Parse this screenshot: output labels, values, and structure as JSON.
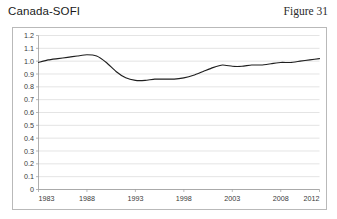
{
  "header": {
    "title": "Canada-SOFI",
    "figure_label": "Figure 31"
  },
  "chart_data": {
    "type": "line",
    "title": "Canada-SOFI",
    "xlabel": "",
    "ylabel": "",
    "xlim": [
      1983,
      2012
    ],
    "ylim": [
      0,
      1.2
    ],
    "grid": true,
    "legend": false,
    "line_color": "#1f1f1f",
    "grid_color": "#d9d9d9",
    "axis_color": "#9a9a9a",
    "xticks": [
      "1983",
      "1988",
      "1993",
      "1998",
      "2003",
      "2008",
      "2012"
    ],
    "xtick_values": [
      1983,
      1988,
      1993,
      1998,
      2003,
      2008,
      2012
    ],
    "yticks": [
      "0",
      "0.1",
      "0.2",
      "0.3",
      "0.4",
      "0.5",
      "0.6",
      "0.7",
      "0.8",
      "0.9",
      "1.0",
      "1.1",
      "1.2"
    ],
    "ytick_values": [
      0,
      0.1,
      0.2,
      0.3,
      0.4,
      0.5,
      0.6,
      0.7,
      0.8,
      0.9,
      1.0,
      1.1,
      1.2
    ],
    "series": [
      {
        "name": "Canada-SOFI",
        "x": [
          1983,
          1984,
          1985,
          1986,
          1987,
          1988,
          1989,
          1990,
          1991,
          1992,
          1993,
          1994,
          1995,
          1996,
          1997,
          1998,
          1999,
          2000,
          2001,
          2002,
          2003,
          2004,
          2005,
          2006,
          2007,
          2008,
          2009,
          2010,
          2011,
          2012
        ],
        "values": [
          0.99,
          1.01,
          1.02,
          1.03,
          1.04,
          1.05,
          1.04,
          0.99,
          0.92,
          0.87,
          0.85,
          0.85,
          0.86,
          0.86,
          0.86,
          0.87,
          0.89,
          0.92,
          0.95,
          0.97,
          0.96,
          0.96,
          0.97,
          0.97,
          0.98,
          0.99,
          0.99,
          1.0,
          1.01,
          1.02
        ]
      }
    ]
  }
}
